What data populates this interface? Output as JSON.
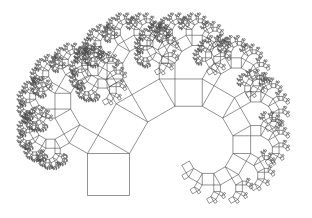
{
  "figure": {
    "title": "Pythagoras tree fractal",
    "background": "#ffffff",
    "stroke_color": "#4a4a4a",
    "stroke_width": 0.6
  },
  "tree": {
    "base_square": {
      "x": 87.5,
      "y": 153.5,
      "size": 42
    },
    "left_angle_deg": 60,
    "depth": 11
  }
}
